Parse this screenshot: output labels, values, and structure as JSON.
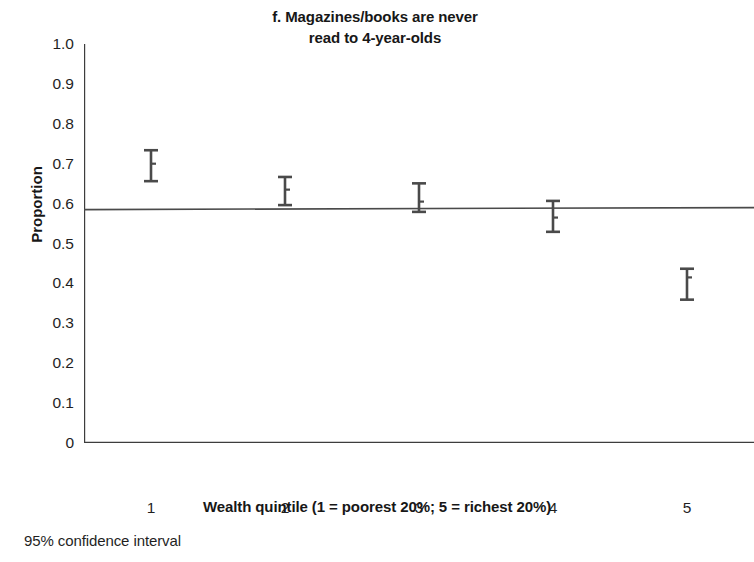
{
  "chart_data": {
    "type": "scatter",
    "title": "f. Magazines/books are never read to 4-year-olds",
    "title_lines": [
      "f. Magazines/books are never",
      "read to 4-year-olds"
    ],
    "xlabel": "Wealth quintile (1 = poorest 20%; 5 = richest 20%)",
    "ylabel": "Proportion",
    "footnote": "95% confidence interval",
    "categories": [
      "1",
      "2",
      "3",
      "4",
      "5"
    ],
    "x": [
      1,
      2,
      3,
      4,
      5
    ],
    "values": [
      0.7,
      0.635,
      0.605,
      0.565,
      0.415
    ],
    "ci_low": [
      0.655,
      0.595,
      0.578,
      0.528,
      0.358
    ],
    "ci_high": [
      0.735,
      0.668,
      0.652,
      0.608,
      0.438
    ],
    "error_bars": "95% confidence interval",
    "trend_line": {
      "x": [
        0.5,
        5.5
      ],
      "y": [
        0.585,
        0.59
      ]
    },
    "xlim": [
      0.5,
      5.5
    ],
    "ylim": [
      0,
      1.0
    ],
    "yticks": [
      0,
      0.1,
      0.2,
      0.3,
      0.4,
      0.5,
      0.6,
      0.7,
      0.8,
      0.9,
      1.0
    ],
    "ytick_labels": [
      "0",
      "0.1",
      "0.2",
      "0.3",
      "0.4",
      "0.5",
      "0.6",
      "0.7",
      "0.8",
      "0.9",
      "1.0"
    ],
    "xticks": [
      1,
      2,
      3,
      4,
      5
    ],
    "xtick_labels": [
      "1",
      "2",
      "3",
      "4",
      "5"
    ],
    "grid": false,
    "legend": "none",
    "colors": {
      "axis": "#3d3d3d",
      "marker": "#4a4a4a",
      "error_bar": "#4a4a4a",
      "trend_line": "#4a4a4a",
      "text": "#1f1f1f"
    }
  }
}
